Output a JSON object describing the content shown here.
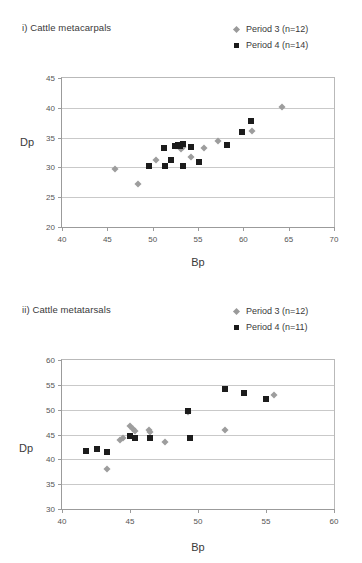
{
  "figures": [
    {
      "title": "i) Cattle metacarpals",
      "legend": [
        {
          "label": "Period 3 (n=12)",
          "marker": "diamond-marker-icon",
          "color": "#9a9a9a"
        },
        {
          "label": "Period 4 (n=14)",
          "marker": "square-marker-icon",
          "color": "#1a1a1a"
        }
      ],
      "chart_data": {
        "type": "scatter",
        "title": "i) Cattle metacarpals",
        "xlabel": "Bp",
        "ylabel": "Dp",
        "xlim": [
          40,
          70
        ],
        "ylim": [
          20,
          45
        ],
        "xticks": [
          40,
          45,
          50,
          55,
          60,
          65,
          70
        ],
        "yticks": [
          20,
          25,
          30,
          35,
          40,
          45
        ],
        "grid": true,
        "legend_position": "top-right",
        "series": [
          {
            "name": "Period 3 (n=12)",
            "marker": "diamond",
            "color": "#9d9d9d",
            "points": [
              [
                45.8,
                29.8
              ],
              [
                48.4,
                27.2
              ],
              [
                50.4,
                31.2
              ],
              [
                52.6,
                33.6
              ],
              [
                53.0,
                33.7
              ],
              [
                53.4,
                33.5
              ],
              [
                53.1,
                33.1
              ],
              [
                54.2,
                31.7
              ],
              [
                55.7,
                33.3
              ],
              [
                57.2,
                34.4
              ],
              [
                61.0,
                36.1
              ],
              [
                64.3,
                40.2
              ]
            ]
          },
          {
            "name": "Period 4 (n=14)",
            "marker": "square",
            "color": "#1c1c1c",
            "points": [
              [
                49.6,
                30.2
              ],
              [
                51.3,
                33.2
              ],
              [
                51.4,
                30.2
              ],
              [
                52.0,
                31.2
              ],
              [
                52.5,
                33.6
              ],
              [
                52.8,
                33.7
              ],
              [
                53.0,
                33.6
              ],
              [
                53.3,
                33.9
              ],
              [
                53.3,
                30.3
              ],
              [
                54.2,
                33.5
              ],
              [
                55.1,
                30.9
              ],
              [
                58.2,
                33.7
              ],
              [
                59.8,
                36.0
              ],
              [
                60.8,
                37.8
              ]
            ]
          }
        ]
      }
    },
    {
      "title": "ii) Cattle metatarsals",
      "legend": [
        {
          "label": "Period 3 (n=12)",
          "marker": "diamond-marker-icon",
          "color": "#9a9a9a"
        },
        {
          "label": "Period 4 (n=11)",
          "marker": "square-marker-icon",
          "color": "#1a1a1a"
        }
      ],
      "chart_data": {
        "type": "scatter",
        "title": "ii) Cattle metatarsals",
        "xlabel": "Bp",
        "ylabel": "Dp",
        "xlim": [
          40,
          60
        ],
        "ylim": [
          30,
          60
        ],
        "xticks": [
          40,
          45,
          50,
          55,
          60
        ],
        "yticks": [
          30,
          35,
          40,
          45,
          50,
          55,
          60
        ],
        "grid": true,
        "legend_position": "top-right",
        "series": [
          {
            "name": "Period 3 (n=12)",
            "marker": "diamond",
            "color": "#9d9d9d",
            "points": [
              [
                43.3,
                38.1
              ],
              [
                44.3,
                43.8
              ],
              [
                44.5,
                44.2
              ],
              [
                45.0,
                46.7
              ],
              [
                45.2,
                46.2
              ],
              [
                45.4,
                45.8
              ],
              [
                46.4,
                46.0
              ],
              [
                46.5,
                45.6
              ],
              [
                47.6,
                43.5
              ],
              [
                49.3,
                49.5
              ],
              [
                52.0,
                46.0
              ],
              [
                55.6,
                53.0
              ]
            ]
          },
          {
            "name": "Period 4 (n=11)",
            "marker": "square",
            "color": "#1c1c1c",
            "points": [
              [
                41.8,
                41.7
              ],
              [
                42.6,
                42.1
              ],
              [
                43.3,
                41.5
              ],
              [
                45.0,
                44.6
              ],
              [
                45.4,
                44.2
              ],
              [
                46.5,
                44.3
              ],
              [
                49.3,
                49.8
              ],
              [
                49.4,
                44.3
              ],
              [
                52.0,
                54.1
              ],
              [
                53.4,
                53.3
              ],
              [
                55.0,
                52.2
              ]
            ]
          }
        ]
      }
    }
  ]
}
